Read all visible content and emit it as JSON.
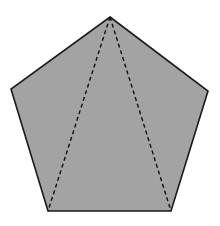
{
  "diagram": {
    "type": "geometric-figure",
    "shape": "regular-pentagon",
    "fill_color": "#a3a3a3",
    "stroke_color": "#1a1a1a",
    "vertices": {
      "top": [
        110,
        17
      ],
      "left": [
        11,
        89
      ],
      "right": [
        208,
        91
      ],
      "bottom_left": [
        48,
        211
      ],
      "bottom_right": [
        171,
        211
      ]
    },
    "diagonals": [
      {
        "from": "top",
        "to": "bottom_left",
        "style": "dashed"
      },
      {
        "from": "top",
        "to": "bottom_right",
        "style": "dashed"
      }
    ],
    "labels": []
  }
}
